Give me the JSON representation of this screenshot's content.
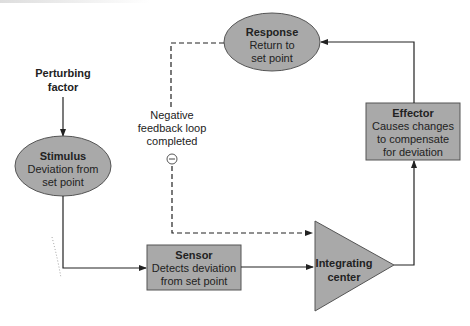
{
  "diagram": {
    "title": "Negative feedback loop",
    "nodes": {
      "perturbing": {
        "line1": "Perturbing",
        "line2": "factor"
      },
      "stimulus": {
        "title": "Stimulus",
        "line1": "Deviation from",
        "line2": "set point"
      },
      "sensor": {
        "title": "Sensor",
        "line1": "Detects deviation",
        "line2": "from set point"
      },
      "integrating": {
        "line1": "Integrating",
        "line2": "center"
      },
      "effector": {
        "title": "Effector",
        "line1": "Causes changes",
        "line2": "to compensate",
        "line3": "for deviation"
      },
      "response": {
        "title": "Response",
        "line1": "Return to",
        "line2": "set point"
      }
    },
    "feedback": {
      "line1": "Negative",
      "line2": "feedback loop",
      "line3": "completed",
      "symbol": "−"
    },
    "colors": {
      "node_fill": "#a9a9a9",
      "stroke": "#222222",
      "background": "#ffffff"
    }
  }
}
